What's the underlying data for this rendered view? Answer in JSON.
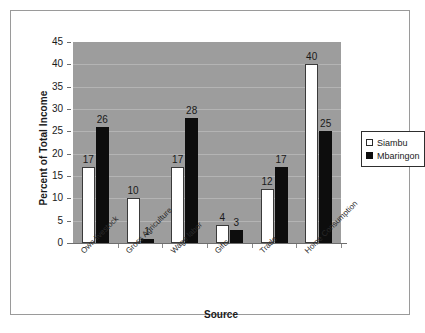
{
  "chart_data": {
    "type": "bar",
    "title": "",
    "xlabel": "Source",
    "ylabel": "Percent of Total Income",
    "ylim": [
      0,
      45
    ],
    "yticks": [
      0,
      5,
      10,
      15,
      20,
      25,
      30,
      35,
      40,
      45
    ],
    "grid": true,
    "legend_position": "right",
    "categories": [
      "Own livestock",
      "Gross Agriculture",
      "Wage labor",
      "Gifts",
      "Trade",
      "Home Consumption"
    ],
    "series": [
      {
        "name": "Siambu",
        "color": "#ffffff",
        "values": [
          17,
          10,
          17,
          4,
          12,
          40
        ]
      },
      {
        "name": "Mbaringon",
        "color": "#0d0d0d",
        "values": [
          26,
          1,
          28,
          3,
          17,
          25
        ]
      }
    ]
  },
  "legend": {
    "items": [
      {
        "label": "Siambu",
        "swatch": "open-square-icon"
      },
      {
        "label": "Mbaringon",
        "swatch": "filled-square-icon"
      }
    ]
  },
  "colors": {
    "plot_background": "#9d9d9d",
    "gridline": "#b4b4b4",
    "frame_border": "#9a9a9a",
    "axis_line": "#6e6e6e",
    "text": "#1a1a1a"
  }
}
